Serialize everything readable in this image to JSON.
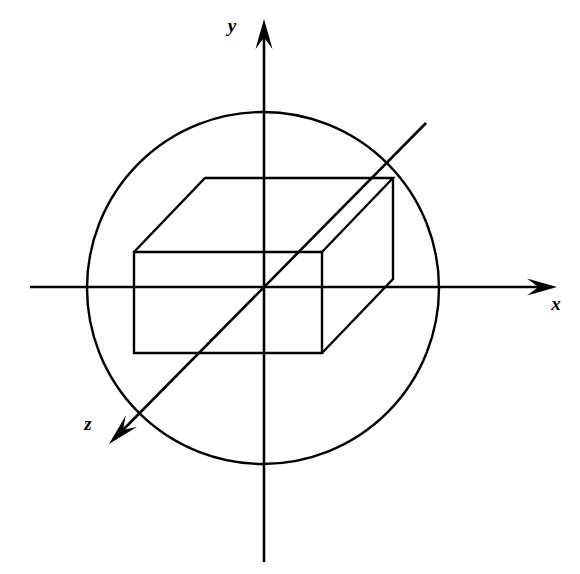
{
  "figure": {
    "background_color": "#ffffff",
    "stroke_color": "#000000",
    "axes": {
      "x": {
        "label": "x",
        "label_x": 556,
        "label_y": 310,
        "line": {
          "x1": 30,
          "y1": 287,
          "x2": 548,
          "y2": 287
        },
        "arrow_tip": {
          "x": 557,
          "y": 287
        },
        "direction": "right"
      },
      "y": {
        "label": "y",
        "label_x": 232,
        "label_y": 32,
        "line": {
          "x1": 264,
          "y1": 562,
          "x2": 264,
          "y2": 28
        },
        "arrow_tip": {
          "x": 264,
          "y": 19
        },
        "direction": "up"
      },
      "z": {
        "label": "z",
        "label_x": 88,
        "label_y": 430,
        "line": {
          "x1": 426,
          "y1": 123,
          "x2": 117,
          "y2": 436
        },
        "arrow_tip": {
          "x": 109,
          "y": 444
        },
        "direction": "down-left"
      }
    },
    "circle": {
      "name": "sphere-outline",
      "cx": 263,
      "cy": 288,
      "r": 176
    },
    "box": {
      "name": "rectangular-box",
      "front_face": {
        "left": 134,
        "top": 252,
        "right": 322,
        "bottom": 353
      },
      "depth_offset": {
        "dx": 71,
        "dy": -74
      },
      "back_face": {
        "left": 205,
        "top": 178,
        "right": 393,
        "bottom": 279
      }
    },
    "stroke_widths": {
      "axis": 2.6,
      "circle": 2.4,
      "box": 2.4
    }
  }
}
